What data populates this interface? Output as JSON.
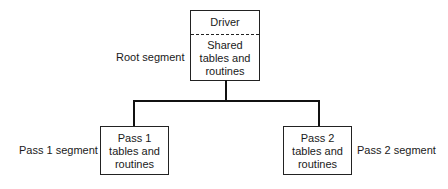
{
  "diagram": {
    "root": {
      "label": "Root segment",
      "header": "Driver",
      "body_lines": [
        "Shared",
        "tables and",
        "routines"
      ]
    },
    "pass1": {
      "label": "Pass 1 segment",
      "body_lines": [
        "Pass 1",
        "tables and",
        "routines"
      ]
    },
    "pass2": {
      "label": "Pass 2 segment",
      "body_lines": [
        "Pass 2",
        "tables and",
        "routines"
      ]
    },
    "colors": {
      "line": "#111111",
      "box_border": "#222222",
      "text": "#1a1a1a",
      "background": "#ffffff"
    }
  }
}
